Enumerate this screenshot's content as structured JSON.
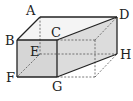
{
  "diagram": {
    "type": "rectangular-prism",
    "colors": {
      "edge": "#222222",
      "hidden_edge": "#555555",
      "face_front": "#d6d6d6",
      "face_side": "#dcdcdc",
      "face_top": "#f4f4f4"
    },
    "vertices": {
      "A": {
        "label": "A",
        "x": 40,
        "y": 17
      },
      "B": {
        "label": "B",
        "x": 17,
        "y": 40
      },
      "C": {
        "label": "C",
        "x": 57,
        "y": 40
      },
      "D": {
        "label": "D",
        "x": 117,
        "y": 17
      },
      "E": {
        "label": "E",
        "x": 40,
        "y": 54
      },
      "F": {
        "label": "F",
        "x": 17,
        "y": 77
      },
      "G": {
        "label": "G",
        "x": 57,
        "y": 77
      },
      "H": {
        "label": "H",
        "x": 117,
        "y": 54
      }
    },
    "labels": {
      "A": "A",
      "B": "B",
      "C": "C",
      "D": "D",
      "E": "E",
      "F": "F",
      "G": "G",
      "H": "H"
    }
  }
}
